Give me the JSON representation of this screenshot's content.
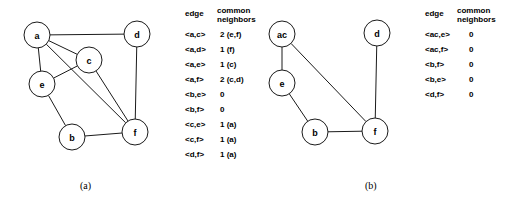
{
  "figure": {
    "width": 516,
    "height": 206,
    "background": "#ffffff",
    "stroke_color": "#1a1a1a"
  },
  "panels": [
    {
      "id": "a",
      "caption": "(a)",
      "caption_x": 80,
      "caption_y": 180,
      "node_radius": 13,
      "nodes": [
        {
          "id": "a",
          "label": "a",
          "cx": 37,
          "cy": 35
        },
        {
          "id": "c",
          "label": "c",
          "cx": 89,
          "cy": 60
        },
        {
          "id": "d",
          "label": "d",
          "cx": 137,
          "cy": 34
        },
        {
          "id": "e",
          "label": "e",
          "cx": 42,
          "cy": 84
        },
        {
          "id": "b",
          "label": "b",
          "cx": 72,
          "cy": 137
        },
        {
          "id": "f",
          "label": "f",
          "cx": 135,
          "cy": 132
        }
      ],
      "edges": [
        {
          "from": "a",
          "to": "d"
        },
        {
          "from": "a",
          "to": "c"
        },
        {
          "from": "a",
          "to": "e"
        },
        {
          "from": "a",
          "to": "f"
        },
        {
          "from": "c",
          "to": "e"
        },
        {
          "from": "c",
          "to": "f"
        },
        {
          "from": "d",
          "to": "f"
        },
        {
          "from": "e",
          "to": "b"
        },
        {
          "from": "b",
          "to": "f"
        }
      ]
    },
    {
      "id": "b",
      "caption": "(b)",
      "caption_x": 365,
      "caption_y": 180,
      "node_radius": 13,
      "nodes": [
        {
          "id": "ac",
          "label": "ac",
          "cx": 282,
          "cy": 34
        },
        {
          "id": "d",
          "label": "d",
          "cx": 377,
          "cy": 33
        },
        {
          "id": "e",
          "label": "e",
          "cx": 282,
          "cy": 83
        },
        {
          "id": "b",
          "label": "b",
          "cx": 315,
          "cy": 132
        },
        {
          "id": "f",
          "label": "f",
          "cx": 375,
          "cy": 131
        }
      ],
      "edges": [
        {
          "from": "ac",
          "to": "e"
        },
        {
          "from": "ac",
          "to": "f"
        },
        {
          "from": "e",
          "to": "b"
        },
        {
          "from": "b",
          "to": "f"
        },
        {
          "from": "d",
          "to": "f"
        }
      ]
    }
  ],
  "tables": [
    {
      "id": "table-a",
      "headers": {
        "edge": "edge",
        "common": "common",
        "neighbors": "neighbors"
      },
      "rows": [
        {
          "edge": "<a,c>",
          "value": "2 (e,f)"
        },
        {
          "edge": "<a,d>",
          "value": "1 (f)"
        },
        {
          "edge": "<a,e>",
          "value": "1 (c)"
        },
        {
          "edge": "<a,f>",
          "value": "2 (c,d)"
        },
        {
          "edge": "<b,e>",
          "value": "0"
        },
        {
          "edge": "<b,f>",
          "value": "0"
        },
        {
          "edge": "<c,e>",
          "value": "1 (a)"
        },
        {
          "edge": "<c,f>",
          "value": "1 (a)"
        },
        {
          "edge": "<d,f>",
          "value": "1 (a)"
        }
      ]
    },
    {
      "id": "table-b",
      "headers": {
        "edge": "edge",
        "common": "common",
        "neighbors": "neighbors"
      },
      "rows": [
        {
          "edge": "<ac,e>",
          "value": "0"
        },
        {
          "edge": "<ac,f>",
          "value": "0"
        },
        {
          "edge": "<b,f>",
          "value": "0"
        },
        {
          "edge": "<b,e>",
          "value": "0"
        },
        {
          "edge": "<d,f>",
          "value": "0"
        }
      ]
    }
  ]
}
